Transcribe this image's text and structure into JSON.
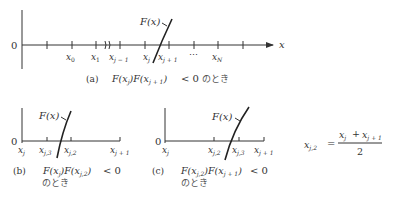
{
  "panel_a": {
    "origin_label": "0",
    "axis_label": "x",
    "curve_label": "F(x)",
    "tick_labels": {
      "x0": {
        "base": "x",
        "sub": "0"
      },
      "x1": {
        "base": "x",
        "sub": "1"
      },
      "xjm1": {
        "base": "x",
        "sub": "j − 1"
      },
      "xj": {
        "base": "x",
        "sub": "j"
      },
      "xjp1": {
        "base": "x",
        "sub": "j + 1"
      },
      "dots": "⋯",
      "xN": {
        "base": "x",
        "sub": "N"
      }
    },
    "caption_tag": "(a)",
    "caption_math": "F(x_j)F(x_{j+1}) < 0",
    "caption_suffix": "のとき"
  },
  "panel_b": {
    "origin_label": "0",
    "curve_label": "F(x)",
    "tick_labels": {
      "xj": {
        "base": "x",
        "sub": "j"
      },
      "xj3": {
        "base": "x",
        "sub": "j,3"
      },
      "xj2": {
        "base": "x",
        "sub": "j,2"
      },
      "xjp1": {
        "base": "x",
        "sub": "j + 1"
      }
    },
    "caption_tag": "(b)",
    "caption_math": "F(x_j)F(x_{j,2}) < 0",
    "caption_suffix": "のとき"
  },
  "panel_c": {
    "origin_label": "0",
    "curve_label": "F(x)",
    "tick_labels": {
      "xj": {
        "base": "x",
        "sub": "j"
      },
      "xj2": {
        "base": "x",
        "sub": "j,2"
      },
      "xj3": {
        "base": "x",
        "sub": "j,3"
      },
      "xjp1": {
        "base": "x",
        "sub": "j + 1"
      }
    },
    "caption_tag": "(c)",
    "caption_math": "F(x_{j,2})F(x_{j+1}) < 0",
    "caption_suffix": "のとき"
  },
  "formula": {
    "lhs": {
      "base": "x",
      "sub": "j,2"
    },
    "equals": "=",
    "numerator_a": {
      "base": "x",
      "sub": "j"
    },
    "plus": "+",
    "numerator_b": {
      "base": "x",
      "sub": "j + 1"
    },
    "denominator": "2"
  }
}
